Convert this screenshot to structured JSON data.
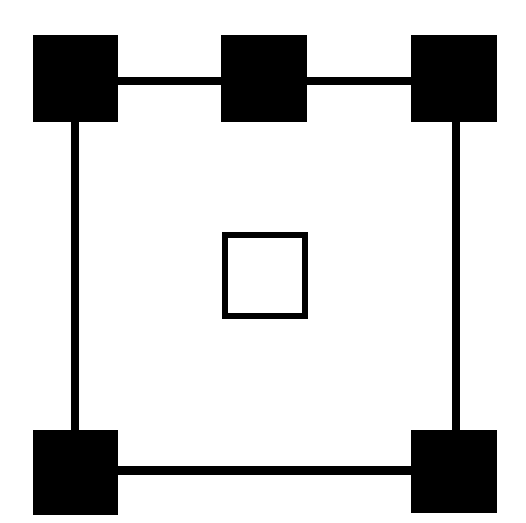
{
  "figure": {
    "canvas": {
      "width": 526,
      "height": 523,
      "background_color": "#ffffff",
      "stroke_color": "#000000"
    },
    "shape_counts": {
      "filled_squares": 5,
      "hollow_squares": 1,
      "connector_lines": 6
    },
    "nodes": [
      {
        "name": "top-left",
        "label": "Top Left Node",
        "fill": "#000000",
        "x": 33,
        "y": 35,
        "width": 85,
        "height": 87
      },
      {
        "name": "top-middle",
        "label": "Top Middle Node",
        "fill": "#000000",
        "x": 221,
        "y": 35,
        "width": 86,
        "height": 87
      },
      {
        "name": "top-right",
        "label": "Top Right Node",
        "fill": "#000000",
        "x": 411,
        "y": 35,
        "width": 86,
        "height": 87
      },
      {
        "name": "bottom-left",
        "label": "Bottom Left Node",
        "fill": "#000000",
        "x": 33,
        "y": 430,
        "width": 85,
        "height": 85
      },
      {
        "name": "bottom-right",
        "label": "Bottom Right Node",
        "fill": "#000000",
        "x": 411,
        "y": 430,
        "width": 86,
        "height": 83
      }
    ],
    "edges": [
      {
        "name": "top-left-to-top-middle",
        "label": "Top Left to Top Middle",
        "orientation": "horizontal",
        "x": 114,
        "y": 77,
        "width": 110,
        "height": 8,
        "color": "#000000"
      },
      {
        "name": "top-middle-to-top-right",
        "label": "Top Middle to Top Right",
        "orientation": "horizontal",
        "x": 303,
        "y": 77,
        "width": 111,
        "height": 8,
        "color": "#000000"
      },
      {
        "name": "top-left-to-bottom-left",
        "label": "Top Left to Bottom Left",
        "orientation": "vertical",
        "x": 71,
        "y": 119,
        "width": 8,
        "height": 314,
        "color": "#000000"
      },
      {
        "name": "top-right-to-bottom-right",
        "label": "Top Right to Bottom Right",
        "orientation": "vertical",
        "x": 452,
        "y": 119,
        "width": 8,
        "height": 314,
        "color": "#000000"
      },
      {
        "name": "bottom-left-to-bottom-right",
        "label": "Bottom Left to Bottom Right",
        "orientation": "horizontal",
        "x": 114,
        "y": 466,
        "width": 300,
        "height": 9,
        "color": "#000000"
      }
    ],
    "center_shape": {
      "name": "center-hollow-square",
      "label": "Center Hollow Square",
      "x": 222,
      "y": 232,
      "width": 86,
      "height": 87,
      "border_width": 6,
      "border_color": "#000000",
      "fill": "transparent"
    }
  }
}
